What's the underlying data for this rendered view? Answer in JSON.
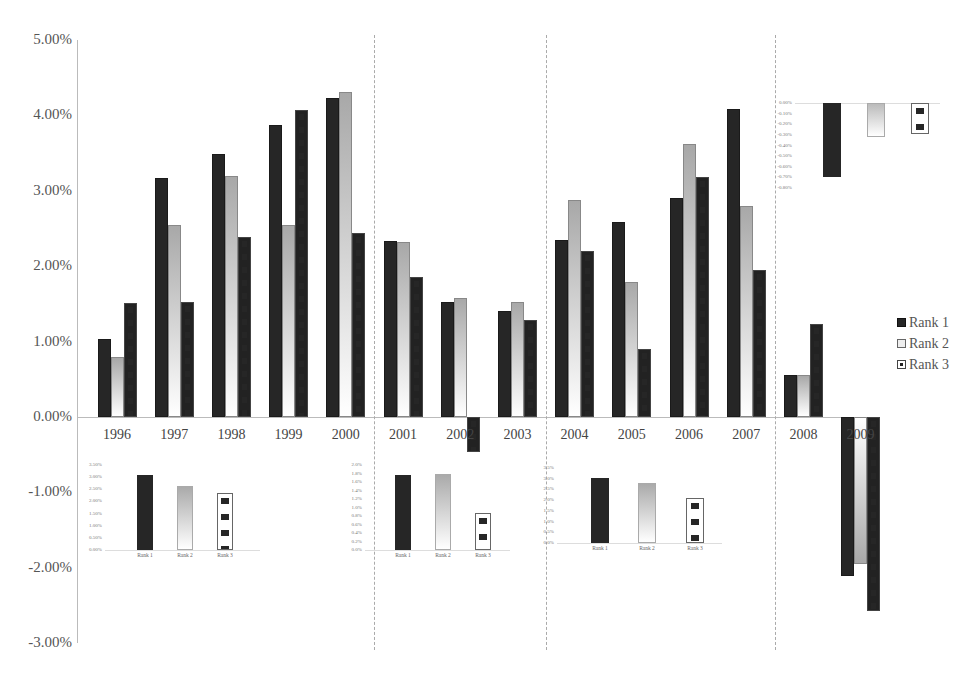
{
  "chart_data": {
    "type": "bar",
    "title": "",
    "xlabel": "",
    "ylabel": "",
    "ylim": [
      -3.0,
      5.0
    ],
    "yticks": [
      "5.00%",
      "4.00%",
      "3.00%",
      "2.00%",
      "1.00%",
      "0.00%",
      "-1.00%",
      "-2.00%",
      "-3.00%"
    ],
    "grid": false,
    "legend_position": "right",
    "categories": [
      "1996",
      "1997",
      "1998",
      "1999",
      "2000",
      "2001",
      "2002",
      "2003",
      "2004",
      "2005",
      "2006",
      "2007",
      "2008",
      "2009"
    ],
    "series": [
      {
        "name": "Rank 1",
        "color": "#262626",
        "values": [
          1.03,
          3.17,
          3.49,
          3.87,
          4.23,
          2.33,
          1.52,
          1.4,
          2.34,
          2.58,
          2.91,
          4.08,
          0.56,
          -2.11
        ]
      },
      {
        "name": "Rank 2",
        "color": "#a8a8a8",
        "values": [
          0.8,
          2.55,
          3.19,
          2.54,
          4.31,
          2.32,
          1.58,
          1.53,
          2.88,
          1.79,
          3.62,
          2.8,
          0.56,
          -1.95
        ]
      },
      {
        "name": "Rank 3",
        "color": "#ffffff",
        "values": [
          1.51,
          1.53,
          2.38,
          4.07,
          2.44,
          1.86,
          -0.47,
          1.28,
          2.2,
          0.9,
          3.18,
          1.95,
          1.23,
          -2.58
        ]
      }
    ],
    "period_separators_after": [
      "2000",
      "2003",
      "2007"
    ],
    "insets": [
      {
        "period": "1996-2000",
        "type": "bar",
        "categories": [
          "Rank 1",
          "Rank 2",
          "Rank 3"
        ],
        "values": [
          3.1,
          2.65,
          2.36
        ],
        "yticks": [
          "3.50%",
          "3.00%",
          "2.50%",
          "2.00%",
          "1.50%",
          "1.00%",
          "0.50%",
          "0.00%"
        ],
        "ylim": [
          0,
          3.5
        ]
      },
      {
        "period": "2001-2003",
        "type": "bar",
        "categories": [
          "Rank 1",
          "Rank 2",
          "Rank 3"
        ],
        "values": [
          1.77,
          1.8,
          0.88
        ],
        "yticks": [
          "2.0%",
          "1.8%",
          "1.6%",
          "1.4%",
          "1.2%",
          "1.0%",
          "0.8%",
          "0.6%",
          "0.4%",
          "0.2%",
          "0.0%"
        ],
        "ylim": [
          0,
          2.0
        ]
      },
      {
        "period": "2004-2007",
        "type": "bar",
        "categories": [
          "Rank 1",
          "Rank 2",
          "Rank 3"
        ],
        "values": [
          3.02,
          2.82,
          2.1
        ],
        "yticks": [
          "3.5%",
          "3.0%",
          "2.5%",
          "2.0%",
          "1.5%",
          "1.0%",
          "0.5%",
          "0.0%"
        ],
        "ylim": [
          0,
          3.5
        ]
      },
      {
        "period": "2008-2009",
        "type": "bar",
        "categories": [
          "Rank 1",
          "Rank 2",
          "Rank 3"
        ],
        "values": [
          -0.7,
          -0.32,
          -0.29
        ],
        "yticks": [
          "0.00%",
          "-0.10%",
          "-0.20%",
          "-0.30%",
          "-0.40%",
          "-0.50%",
          "-0.60%",
          "-0.70%",
          "-0.80%"
        ],
        "ylim": [
          -0.8,
          0
        ]
      }
    ]
  },
  "legend": {
    "items": [
      {
        "label": "Rank 1"
      },
      {
        "label": "Rank 2"
      },
      {
        "label": "Rank 3"
      }
    ]
  }
}
